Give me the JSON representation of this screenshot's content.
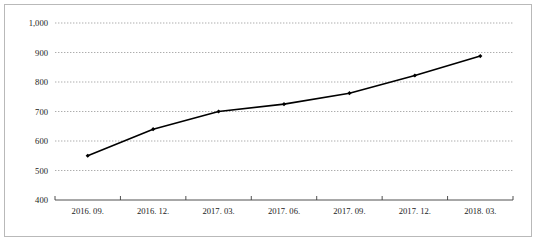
{
  "chart_data": {
    "type": "line",
    "title": "",
    "subtitle": "",
    "xlabel": "",
    "ylabel": "",
    "categories": [
      "2016. 09.",
      "2016. 12.",
      "2017. 03.",
      "2017. 06.",
      "2017. 09.",
      "2017. 12.",
      "2018. 03."
    ],
    "series": [
      {
        "name": "",
        "values": [
          550,
          640,
          700,
          725,
          762,
          822,
          888
        ],
        "color": "#000000",
        "marker": "diamond"
      }
    ],
    "ylim": [
      400,
      1000
    ],
    "yticks": [
      400,
      500,
      600,
      700,
      800,
      900,
      1000
    ],
    "ytick_labels": [
      "400",
      "500",
      "600",
      "700",
      "800",
      "900",
      "1,000"
    ],
    "grid": true,
    "grid_axis": "y",
    "grid_style": "dotted",
    "legend": false,
    "legend_position": "none",
    "border": true,
    "border_color": "#b9b9b9",
    "background": "#ffffff",
    "annotations": []
  },
  "axes": {
    "y_axis_name": "value-axis",
    "x_axis_name": "category-axis"
  }
}
